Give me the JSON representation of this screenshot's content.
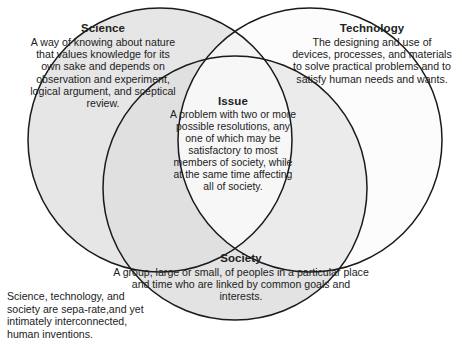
{
  "diagram": {
    "type": "venn-three-circle",
    "colors": {
      "science_fill": "#e4e4e4",
      "technology_fill": "#fbfbfb",
      "society_fill": "#e2e2e2",
      "stroke": "#1a1a1a",
      "text": "#222222",
      "background": "#ffffff"
    },
    "circles": [
      {
        "name": "science",
        "label": "Science",
        "cx": 160,
        "cy": 140,
        "r": 132
      },
      {
        "name": "technology",
        "label": "Technology",
        "cx": 310,
        "cy": 140,
        "r": 132
      },
      {
        "name": "society",
        "label": "Society",
        "cx": 235,
        "cy": 188,
        "r": 132
      }
    ],
    "regions": [
      {
        "name": "science",
        "heading": "Science",
        "body": "A way of knowing about nature that values knowledge for its own sake and depends on observation and experiment, logical argument, and sceptical review."
      },
      {
        "name": "technology",
        "heading": "Technology",
        "body": "The designing and use of devices, processes, and materials to solve practical problems and to satisfy human needs and wants."
      },
      {
        "name": "issue",
        "heading": "Issue",
        "body": "A problem with two or more possible resolutions, any one of which may be satisfactory to most members of society, while at the same time affecting all of society."
      },
      {
        "name": "society",
        "heading": "Society",
        "body": "A group, large or small, of peoples in a particular place and time who are linked by common goals and interests."
      }
    ],
    "caption": "Science, technology, and society are sepa-rate,and yet intimately interconnected, human inventions."
  }
}
